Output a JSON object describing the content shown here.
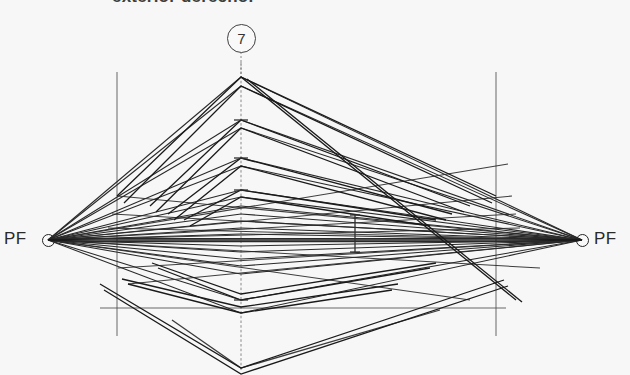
{
  "document": {
    "kind": "scanned-technical-drawing",
    "subject": "two-point perspective construction",
    "caption_top": "exterior derecho.",
    "figure_number": "7"
  },
  "labels": {
    "vanishing_point_left": "PF",
    "vanishing_point_right": "PF"
  },
  "icons": {
    "vp_marker_left": "vanishing-point-circle",
    "vp_marker_right": "vanishing-point-circle",
    "figure_badge": "circled-number"
  },
  "colors": {
    "paper": "#fdfdfd",
    "ink": "#141414",
    "guide": "#4a4a4a",
    "horizon": "#101010"
  },
  "geometry": {
    "vanishing_point_left_xy": [
      48,
      240
    ],
    "vanishing_point_right_xy": [
      582,
      240
    ],
    "horizon_y": 240,
    "center_axis_x": 241,
    "left_vertical_guide_x": 117,
    "right_vertical_guide_x": 496,
    "ground_line_y": 308,
    "apex_y": 77,
    "lowest_vertex_y": 368,
    "center_axis_vertices_y": [
      77,
      120,
      158,
      190,
      214,
      228,
      240,
      252,
      266,
      300,
      313,
      368
    ],
    "measure_tick_x": 355,
    "measure_tick_y_range": [
      215,
      252
    ]
  }
}
